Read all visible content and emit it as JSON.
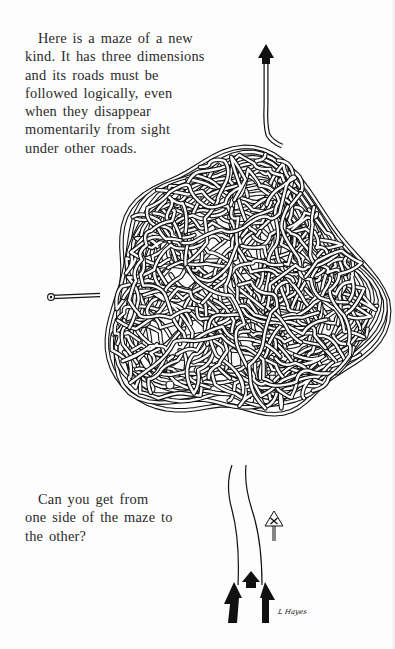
{
  "page": {
    "intro_text": "Here is a maze of a new kind. It has three dimensions and its roads must be followed logically, even when they disappear momentarily from sight under other roads.",
    "question_text": "Can you get from one side of the maze to the other?",
    "signature": "L Hayes"
  },
  "maze": {
    "start_marker": "circle-start-left",
    "exit_arrow": "arrow-up-top",
    "entry_arrows": [
      "arrow-up-left",
      "arrow-up-center",
      "arrow-up-right"
    ],
    "road_sign": "crossroads-warning-sign",
    "ink_color": "#111111",
    "paper_color": "#fdfdfd"
  }
}
